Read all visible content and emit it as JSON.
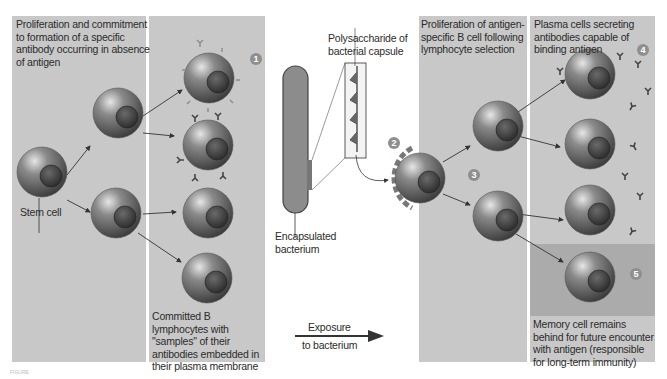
{
  "figure": {
    "panels": {
      "left_text": "Proliferation and commitment to formation of a specific antibody occurring in absence of antigen",
      "stem_cell_label": "Stem cell",
      "committed_label": "Committed B lymphocytes with \"samples\" of their antibodies embedded in their plasma membrane",
      "polysaccharide_label": "Polysaccharide of bacterial capsule",
      "bacterium_label": "Encapsulated bacterium",
      "exposure_label_top": "Exposure",
      "exposure_label_bottom": "to bacterium",
      "proliferation_label": "Proliferation of antigen-specific B cell following lymphocyte selection",
      "plasma_label": "Plasma cells secreting antibodies capable of binding antigen",
      "memory_label": "Memory cell remains behind for future encounter with antigen (responsible for long-term immunity)"
    },
    "step_numbers": [
      "1",
      "2",
      "3",
      "4",
      "5"
    ],
    "caption": "FIGURE"
  },
  "colors": {
    "panel": "#c8c8c8",
    "memory_band": "#ababab",
    "cell": "#6e6e6e",
    "number_badge": "#8f8f8f"
  }
}
